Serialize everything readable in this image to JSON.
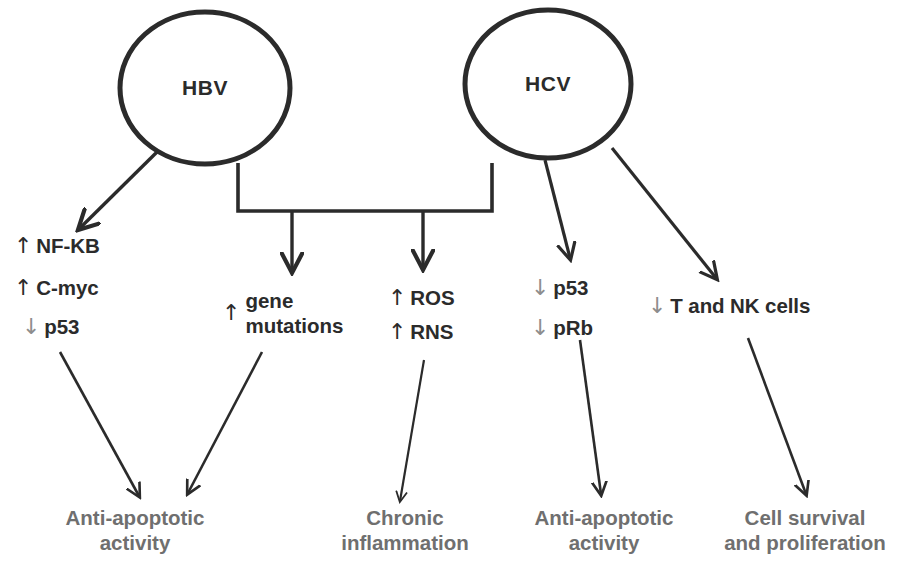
{
  "diagram": {
    "colors": {
      "stroke_dark": "#2b2b2b",
      "arrow_gray": "#8d8d8d",
      "outcome_gray": "#6f6f6f",
      "background": "#ffffff"
    },
    "nodes": [
      {
        "id": "hbv",
        "label": "HBV",
        "shape": "circle"
      },
      {
        "id": "hcv",
        "label": "HCV",
        "shape": "circle"
      }
    ],
    "factors": [
      {
        "id": "nfkb",
        "direction": "up",
        "arrow": "↑",
        "label": "NF-KB"
      },
      {
        "id": "cmyc",
        "direction": "up",
        "arrow": "↑",
        "label": "C-myc"
      },
      {
        "id": "p53-left",
        "direction": "down",
        "arrow": "↓",
        "label": "p53"
      },
      {
        "id": "gene-mutations",
        "direction": "up",
        "arrow": "↑",
        "line1": "gene",
        "line2": "mutations"
      },
      {
        "id": "ros",
        "direction": "up",
        "arrow": "↑",
        "label": "ROS"
      },
      {
        "id": "rns",
        "direction": "up",
        "arrow": "↑",
        "label": "RNS"
      },
      {
        "id": "p53-right",
        "direction": "down",
        "arrow": "↓",
        "label": "p53"
      },
      {
        "id": "prb",
        "direction": "down",
        "arrow": "↓",
        "label": "pRb"
      },
      {
        "id": "t-nk-cells",
        "direction": "down",
        "arrow": "↓",
        "label": "T and NK cells"
      }
    ],
    "outcomes": [
      {
        "id": "anti-apoptotic-left",
        "line1": "Anti-apoptotic",
        "line2": "activity"
      },
      {
        "id": "chronic-inflammation",
        "line1": "Chronic",
        "line2": "inflammation"
      },
      {
        "id": "anti-apoptotic-right",
        "line1": "Anti-apoptotic",
        "line2": "activity"
      },
      {
        "id": "cell-survival",
        "line1": "Cell survival",
        "line2": "and proliferation"
      }
    ]
  }
}
